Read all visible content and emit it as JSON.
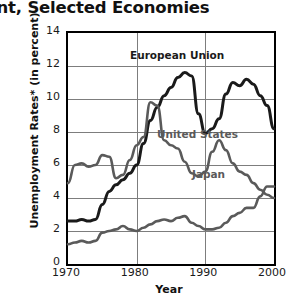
{
  "chart_data": {
    "type": "line",
    "title_visible_text": "yment, Selected Economies",
    "xlabel": "Year",
    "ylabel": "Unemployment Rates* (in percent)",
    "xlim": [
      1970,
      2000
    ],
    "ylim": [
      0,
      14
    ],
    "xticks": [
      "1970",
      "1980",
      "1990",
      "2000"
    ],
    "yticks": [
      "0",
      "2",
      "4",
      "6",
      "8",
      "10",
      "12",
      "14"
    ],
    "grid": "both",
    "legend_position": "inline-annotations",
    "x": [
      1970,
      1971,
      1972,
      1973,
      1974,
      1975,
      1976,
      1977,
      1978,
      1979,
      1980,
      1981,
      1982,
      1983,
      1984,
      1985,
      1986,
      1987,
      1988,
      1989,
      1990,
      1991,
      1992,
      1993,
      1994,
      1995,
      1996,
      1997,
      1998,
      1999,
      2000
    ],
    "series": [
      {
        "name": "European Union",
        "color": "#1a1a1a",
        "label_position": {
          "x": 1979,
          "y": 12.6
        },
        "values": [
          2.6,
          2.6,
          2.7,
          2.6,
          2.7,
          3.6,
          4.4,
          4.8,
          5.1,
          5.5,
          6.0,
          7.3,
          8.7,
          9.5,
          10.2,
          10.7,
          11.3,
          11.6,
          11.4,
          9.1,
          7.9,
          8.2,
          8.8,
          10.3,
          11.0,
          10.8,
          11.2,
          10.9,
          10.2,
          9.6,
          8.2
        ]
      },
      {
        "name": "United States",
        "color": "#5a5a5a",
        "label_position": {
          "x": 1983,
          "y": 7.8
        },
        "values": [
          4.9,
          6.0,
          6.1,
          5.9,
          6.0,
          6.6,
          6.5,
          5.2,
          5.4,
          6.3,
          7.2,
          7.7,
          9.8,
          9.6,
          7.5,
          7.2,
          7.0,
          6.2,
          5.5,
          5.3,
          5.6,
          6.8,
          7.5,
          6.9,
          6.1,
          5.6,
          5.4,
          4.9,
          4.5,
          4.2,
          4.0
        ]
      },
      {
        "name": "Japan",
        "color": "#5a5a5a",
        "label_position": {
          "x": 1988,
          "y": 5.4
        },
        "values": [
          1.2,
          1.3,
          1.4,
          1.3,
          1.4,
          1.9,
          2.0,
          2.1,
          2.3,
          2.1,
          2.0,
          2.2,
          2.4,
          2.6,
          2.7,
          2.6,
          2.8,
          2.9,
          2.5,
          2.3,
          2.1,
          2.1,
          2.2,
          2.5,
          2.9,
          3.1,
          3.4,
          3.4,
          4.1,
          4.7,
          4.7
        ]
      }
    ]
  },
  "axes": {
    "y_title": "Unemployment Rates* (in percent)",
    "x_title": "Year"
  },
  "labels": {
    "european_union": "European Union",
    "united_states": "United States",
    "japan": "Japan"
  },
  "ticks": {
    "y": [
      "14",
      "12",
      "10",
      "8",
      "6",
      "4",
      "2",
      "0"
    ],
    "x": [
      "1970",
      "1980",
      "1990",
      "2000"
    ]
  },
  "title": {
    "text": "yment, Selected Economies"
  }
}
